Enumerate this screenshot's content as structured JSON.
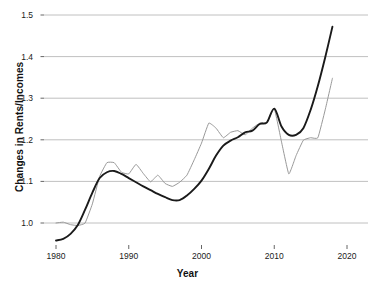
{
  "chart_data": {
    "type": "line",
    "title": "",
    "xlabel": "Year",
    "ylabel": "Changes in Rents/Incomes",
    "xlim": [
      1978,
      2021.8
    ],
    "ylim": [
      0.95,
      1.5
    ],
    "xticks": [
      1980,
      1990,
      2000,
      2010,
      2020
    ],
    "xtick_labels": [
      "1980",
      "1990",
      "2000",
      "2010",
      "2020"
    ],
    "yticks": [
      1.0,
      1.1,
      1.2,
      1.3,
      1.4,
      1.5
    ],
    "ytick_labels": [
      "1.0",
      "1.1",
      "1.2",
      "1.3",
      "1.4",
      "1.5"
    ],
    "grid": "horizontal",
    "legend": "none",
    "series": [
      {
        "name": "black-series",
        "color": "#1a1a1a",
        "width": 1.9,
        "x": [
          1980,
          1981,
          1982,
          1983,
          1984,
          1985,
          1986,
          1987,
          1988,
          1989,
          1990,
          1991,
          1992,
          1993,
          1994,
          1995,
          1996,
          1997,
          1998,
          1999,
          2000,
          2001,
          2002,
          2003,
          2004,
          2005,
          2006,
          2007,
          2008,
          2009,
          2010,
          2011,
          2012,
          2013,
          2014,
          2015,
          2016,
          2017,
          2018
        ],
        "values": [
          0.958,
          0.962,
          0.974,
          0.995,
          1.032,
          1.073,
          1.108,
          1.122,
          1.125,
          1.118,
          1.108,
          1.098,
          1.088,
          1.079,
          1.07,
          1.062,
          1.055,
          1.055,
          1.066,
          1.082,
          1.102,
          1.13,
          1.162,
          1.186,
          1.198,
          1.206,
          1.218,
          1.222,
          1.238,
          1.242,
          1.275,
          1.232,
          1.212,
          1.212,
          1.228,
          1.272,
          1.33,
          1.398,
          1.472
        ]
      },
      {
        "name": "gray-series",
        "color": "#999999",
        "width": 1.0,
        "x": [
          1980,
          1981,
          1982,
          1983,
          1984,
          1985,
          1986,
          1987,
          1988,
          1989,
          1990,
          1991,
          1992,
          1993,
          1994,
          1995,
          1996,
          1997,
          1998,
          1999,
          2000,
          2001,
          2002,
          2003,
          2004,
          2005,
          2006,
          2007,
          2008,
          2009,
          2010,
          2011,
          2012,
          2013,
          2014,
          2015,
          2016,
          2017,
          2018
        ],
        "values": [
          1.0,
          1.002,
          0.996,
          0.994,
          1.0,
          1.046,
          1.112,
          1.145,
          1.145,
          1.122,
          1.118,
          1.141,
          1.119,
          1.099,
          1.115,
          1.095,
          1.088,
          1.098,
          1.115,
          1.152,
          1.192,
          1.24,
          1.228,
          1.205,
          1.218,
          1.222,
          1.212,
          1.228,
          1.24,
          1.242,
          1.275,
          1.195,
          1.118,
          1.162,
          1.199,
          1.205,
          1.205,
          1.272,
          1.348
        ]
      }
    ]
  },
  "axes": {
    "x_title": "Year",
    "y_title": "Changes in Rents/Incomes"
  }
}
